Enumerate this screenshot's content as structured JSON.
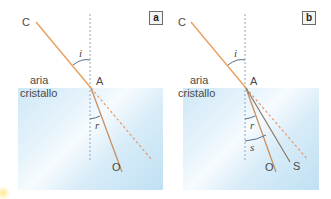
{
  "panels": [
    {
      "id": "a",
      "badge": "a",
      "points": {
        "incident_start": "C",
        "incidence_point": "A",
        "refracted_end": "O"
      },
      "media": {
        "upper": "aria",
        "lower": "cristallo"
      },
      "angles": {
        "incidence": "i",
        "refraction": "r"
      }
    },
    {
      "id": "b",
      "badge": "b",
      "points": {
        "incident_start": "C",
        "incidence_point": "A",
        "refracted_end_1": "O",
        "refracted_end_2": "S"
      },
      "media": {
        "upper": "aria",
        "lower": "cristallo"
      },
      "angles": {
        "incidence": "i",
        "refraction_1": "r",
        "refraction_2": "s"
      }
    }
  ],
  "colors": {
    "ray": "#e8a060",
    "dashed_extension": "#e89868",
    "normal": "#8fa6b8",
    "refracted_b_S": "#8a7a66",
    "glass_light": "#f6fbfe",
    "glass_dark": "#bfe0f4"
  }
}
